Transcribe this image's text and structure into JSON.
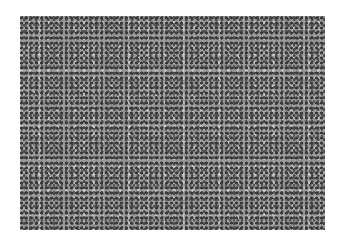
{
  "image": {
    "description": "Grayscale histology micrograph of densely cellular tissue with scattered dark nuclei and lighter streaks",
    "colors": {
      "background": "#ffffff",
      "tissue_base": "#9a9a9a",
      "nuclei": "#3a3a3a"
    }
  }
}
